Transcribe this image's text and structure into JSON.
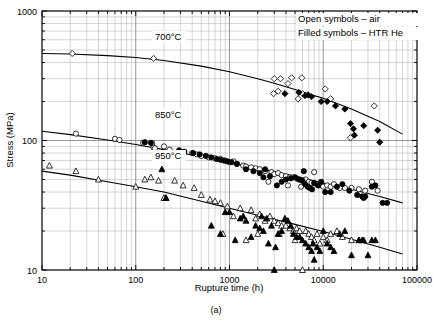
{
  "figure": {
    "caption": "(a)",
    "legend": {
      "line1": "Open symbols – air",
      "line2": "Filled symbols – HTR He"
    }
  },
  "chart_data": {
    "type": "scatter",
    "title": "",
    "xlabel": "Rupture time (h)",
    "ylabel": "Stress (MPa)",
    "xscale": "log",
    "yscale": "log",
    "xlim": [
      10,
      100000
    ],
    "ylim": [
      10,
      1000
    ],
    "xticks": [
      10,
      100,
      1000,
      10000,
      100000
    ],
    "xtick_labels": [
      "10",
      "100",
      "1000",
      "10000",
      "100000"
    ],
    "yticks": [
      10,
      100,
      1000
    ],
    "ytick_labels": [
      "10",
      "100",
      "1000"
    ],
    "grid": "log-minor-both",
    "legend_position": "top-right",
    "annotations": [
      {
        "text": "700°C",
        "x": 160,
        "y": 600
      },
      {
        "text": "850°C",
        "x": 160,
        "y": 150
      },
      {
        "text": "950°C",
        "x": 160,
        "y": 72
      }
    ],
    "curves": [
      {
        "name": "700°C master curve",
        "temperature_C": 700,
        "points": [
          [
            10,
            470
          ],
          [
            20,
            465
          ],
          [
            50,
            452
          ],
          [
            100,
            437
          ],
          [
            200,
            415
          ],
          [
            500,
            375
          ],
          [
            1000,
            340
          ],
          [
            2000,
            300
          ],
          [
            3000,
            277
          ],
          [
            5000,
            248
          ],
          [
            8000,
            222
          ],
          [
            10000,
            212
          ],
          [
            20000,
            175
          ],
          [
            40000,
            140
          ],
          [
            70000,
            112
          ]
        ]
      },
      {
        "name": "850°C master curve",
        "temperature_C": 850,
        "points": [
          [
            10,
            118
          ],
          [
            20,
            111
          ],
          [
            50,
            101
          ],
          [
            100,
            93
          ],
          [
            200,
            85
          ],
          [
            500,
            75
          ],
          [
            1000,
            68
          ],
          [
            2000,
            61
          ],
          [
            5000,
            53
          ],
          [
            10000,
            47
          ],
          [
            20000,
            42
          ],
          [
            40000,
            37
          ],
          [
            70000,
            33
          ]
        ]
      },
      {
        "name": "950°C master curve",
        "temperature_C": 950,
        "points": [
          [
            10,
            58
          ],
          [
            20,
            54
          ],
          [
            50,
            48
          ],
          [
            100,
            44
          ],
          [
            200,
            40
          ],
          [
            500,
            34
          ],
          [
            1000,
            30
          ],
          [
            2000,
            26.5
          ],
          [
            5000,
            22.5
          ],
          [
            10000,
            19.8
          ],
          [
            20000,
            17.3
          ],
          [
            40000,
            15.0
          ],
          [
            70000,
            13.3
          ]
        ]
      }
    ],
    "series": [
      {
        "name": "700°C air",
        "temperature_C": 700,
        "environment": "air",
        "marker": "open-diamond",
        "points": [
          [
            21,
            470
          ],
          [
            155,
            430
          ],
          [
            3000,
            300
          ],
          [
            3500,
            300
          ],
          [
            4600,
            305
          ],
          [
            5900,
            305
          ],
          [
            2950,
            230
          ],
          [
            3300,
            240
          ],
          [
            5400,
            210
          ],
          [
            6000,
            230
          ],
          [
            10500,
            250
          ],
          [
            12000,
            210
          ],
          [
            19500,
            105
          ],
          [
            35000,
            185
          ],
          [
            4200,
            275
          ]
        ]
      },
      {
        "name": "700°C HTR He",
        "temperature_C": 700,
        "environment": "HTR He",
        "marker": "filled-diamond",
        "points": [
          [
            3900,
            230
          ],
          [
            5500,
            235
          ],
          [
            6400,
            222
          ],
          [
            6900,
            225
          ],
          [
            7500,
            218
          ],
          [
            9500,
            200
          ],
          [
            11000,
            200
          ],
          [
            13500,
            185
          ],
          [
            17000,
            175
          ],
          [
            19500,
            135
          ],
          [
            21000,
            123
          ],
          [
            27000,
            130
          ],
          [
            38000,
            120
          ],
          [
            40000,
            97
          ],
          [
            21500,
            110
          ]
        ]
      },
      {
        "name": "850°C air",
        "temperature_C": 850,
        "environment": "air",
        "marker": "open-circle",
        "points": [
          [
            23,
            113
          ],
          [
            60,
            103
          ],
          [
            67,
            101
          ],
          [
            120,
            96
          ],
          [
            150,
            95
          ],
          [
            155,
            88
          ],
          [
            160,
            87
          ],
          [
            200,
            90
          ],
          [
            230,
            85
          ],
          [
            300,
            82
          ],
          [
            320,
            79
          ],
          [
            400,
            80
          ],
          [
            450,
            78
          ],
          [
            500,
            76
          ],
          [
            600,
            74
          ],
          [
            700,
            73
          ],
          [
            800,
            72
          ],
          [
            900,
            70
          ],
          [
            1000,
            68
          ],
          [
            1100,
            69
          ],
          [
            1200,
            66
          ],
          [
            1400,
            64
          ],
          [
            1500,
            63
          ],
          [
            1700,
            62
          ],
          [
            1900,
            61
          ],
          [
            2100,
            60
          ],
          [
            2400,
            58
          ],
          [
            2800,
            57
          ],
          [
            3000,
            55
          ],
          [
            3300,
            56
          ],
          [
            3600,
            54
          ],
          [
            4000,
            53
          ],
          [
            4400,
            52
          ],
          [
            4800,
            52
          ],
          [
            5200,
            51
          ],
          [
            5600,
            50
          ],
          [
            6000,
            49
          ],
          [
            6500,
            50
          ],
          [
            7000,
            48
          ],
          [
            7500,
            47
          ],
          [
            8000,
            57
          ],
          [
            8500,
            46
          ],
          [
            9000,
            45
          ],
          [
            9500,
            46
          ],
          [
            10000,
            44
          ],
          [
            11000,
            45
          ],
          [
            12000,
            44
          ],
          [
            13000,
            46
          ],
          [
            15000,
            43
          ],
          [
            17000,
            43
          ],
          [
            20000,
            43
          ],
          [
            24000,
            42
          ],
          [
            28000,
            41
          ],
          [
            33000,
            48
          ],
          [
            38000,
            41
          ],
          [
            2600,
            48
          ],
          [
            4200,
            45
          ],
          [
            5800,
            44
          ]
        ]
      },
      {
        "name": "850°C HTR He",
        "temperature_C": 850,
        "environment": "HTR He",
        "marker": "filled-circle",
        "points": [
          [
            125,
            97
          ],
          [
            145,
            96
          ],
          [
            290,
            84
          ],
          [
            330,
            82
          ],
          [
            410,
            80
          ],
          [
            480,
            78
          ],
          [
            560,
            76
          ],
          [
            640,
            74
          ],
          [
            730,
            72
          ],
          [
            800,
            71
          ],
          [
            870,
            70
          ],
          [
            950,
            69
          ],
          [
            1050,
            68
          ],
          [
            1200,
            66
          ],
          [
            1500,
            60
          ],
          [
            1800,
            58
          ],
          [
            2100,
            56
          ],
          [
            2300,
            52
          ],
          [
            2700,
            53
          ],
          [
            3200,
            45
          ],
          [
            3600,
            48
          ],
          [
            4000,
            50
          ],
          [
            4500,
            51
          ],
          [
            5000,
            52
          ],
          [
            5500,
            50
          ],
          [
            6000,
            49
          ],
          [
            6400,
            46
          ],
          [
            6800,
            44
          ],
          [
            7200,
            43
          ],
          [
            7600,
            42
          ],
          [
            8000,
            47
          ],
          [
            8800,
            45
          ],
          [
            9500,
            48
          ],
          [
            10500,
            40
          ],
          [
            12000,
            40
          ],
          [
            14000,
            44
          ],
          [
            16000,
            46
          ],
          [
            19000,
            41
          ],
          [
            23000,
            38
          ],
          [
            26000,
            37
          ],
          [
            27000,
            36
          ],
          [
            28000,
            37
          ],
          [
            33000,
            44
          ],
          [
            36000,
            45
          ],
          [
            43000,
            33
          ],
          [
            48000,
            33
          ],
          [
            2400,
            60
          ],
          [
            6200,
            58
          ]
        ]
      },
      {
        "name": "950°C air",
        "temperature_C": 950,
        "environment": "air",
        "marker": "open-triangle",
        "points": [
          [
            12,
            64
          ],
          [
            23,
            58
          ],
          [
            40,
            50
          ],
          [
            100,
            44
          ],
          [
            125,
            50
          ],
          [
            145,
            52
          ],
          [
            175,
            49
          ],
          [
            200,
            36
          ],
          [
            210,
            36
          ],
          [
            260,
            49
          ],
          [
            320,
            45
          ],
          [
            420,
            43
          ],
          [
            500,
            38
          ],
          [
            620,
            35
          ],
          [
            700,
            34
          ],
          [
            800,
            33
          ],
          [
            850,
            19
          ],
          [
            950,
            31
          ],
          [
            1100,
            26
          ],
          [
            1300,
            30
          ],
          [
            1500,
            17
          ],
          [
            1700,
            29
          ],
          [
            1900,
            25
          ],
          [
            2100,
            27
          ],
          [
            2400,
            24
          ],
          [
            2700,
            26
          ],
          [
            3000,
            24
          ],
          [
            3300,
            23
          ],
          [
            3600,
            22
          ],
          [
            4000,
            22
          ],
          [
            4400,
            21
          ],
          [
            4800,
            20
          ],
          [
            5200,
            21
          ],
          [
            5600,
            20
          ],
          [
            6000,
            10
          ],
          [
            6500,
            20
          ],
          [
            7000,
            19
          ],
          [
            7500,
            18
          ],
          [
            8000,
            17
          ],
          [
            8600,
            19
          ],
          [
            9200,
            16
          ],
          [
            10000,
            18
          ],
          [
            11000,
            17
          ],
          [
            12000,
            19
          ],
          [
            14000,
            20
          ],
          [
            16000,
            18
          ],
          [
            20000,
            17
          ],
          [
            24000,
            17
          ],
          [
            2000,
            19
          ],
          [
            3400,
            19
          ],
          [
            5000,
            17
          ]
        ]
      },
      {
        "name": "950°C HTR He",
        "temperature_C": 950,
        "environment": "HTR He",
        "marker": "filled-triangle",
        "points": [
          [
            190,
            60
          ],
          [
            210,
            36
          ],
          [
            640,
            22
          ],
          [
            800,
            19
          ],
          [
            900,
            28
          ],
          [
            1000,
            28
          ],
          [
            1150,
            17
          ],
          [
            1300,
            25
          ],
          [
            1400,
            26
          ],
          [
            1500,
            24
          ],
          [
            1700,
            18
          ],
          [
            1900,
            22
          ],
          [
            2100,
            21
          ],
          [
            2300,
            20
          ],
          [
            2600,
            16
          ],
          [
            2800,
            22
          ],
          [
            3000,
            10
          ],
          [
            3100,
            15
          ],
          [
            3300,
            19
          ],
          [
            3600,
            20
          ],
          [
            3900,
            25
          ],
          [
            4200,
            24
          ],
          [
            4500,
            22
          ],
          [
            4800,
            19
          ],
          [
            5200,
            18
          ],
          [
            5600,
            18
          ],
          [
            6000,
            17
          ],
          [
            6500,
            16
          ],
          [
            7000,
            15
          ],
          [
            7500,
            14
          ],
          [
            8000,
            12
          ],
          [
            8600,
            15
          ],
          [
            9200,
            14
          ],
          [
            10000,
            20
          ],
          [
            11000,
            16
          ],
          [
            12000,
            15
          ],
          [
            13000,
            14
          ],
          [
            15000,
            19
          ],
          [
            17000,
            20
          ],
          [
            20000,
            13
          ],
          [
            24000,
            17
          ],
          [
            26000,
            17
          ],
          [
            27000,
            17
          ],
          [
            30000,
            13
          ],
          [
            33000,
            17
          ],
          [
            36000,
            17
          ],
          [
            2200,
            26
          ],
          [
            2500,
            25
          ],
          [
            7800,
            16
          ]
        ]
      }
    ]
  }
}
